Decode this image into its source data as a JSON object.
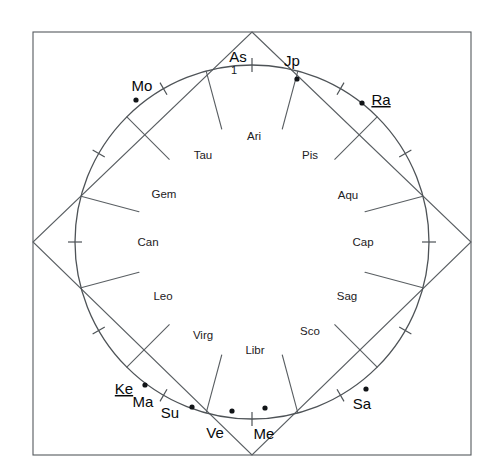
{
  "chart_data": {
    "type": "scatter",
    "title": "",
    "subtitle": "",
    "grid": false,
    "legend_position": "none",
    "xlabel": "",
    "ylabel": "",
    "coordinate_system": "polar-degrees-clockwise-from-top",
    "geometry": {
      "center_x": 252,
      "center_y": 242,
      "circle_radius": 177,
      "frame": {
        "x": 33,
        "y": 32,
        "width": 438,
        "height": 423
      },
      "diamond_vertices": [
        {
          "x": 252,
          "y": 32
        },
        {
          "x": 471,
          "y": 242
        },
        {
          "x": 252,
          "y": 455
        },
        {
          "x": 33,
          "y": 242
        }
      ]
    },
    "signs": [
      {
        "abbr": "Ari",
        "angle_deg": 0,
        "label_x": 254,
        "label_y": 137
      },
      {
        "abbr": "Tau",
        "angle_deg": 330,
        "label_x": 203,
        "label_y": 156
      },
      {
        "abbr": "Gem",
        "angle_deg": 300,
        "label_x": 164,
        "label_y": 195
      },
      {
        "abbr": "Can",
        "angle_deg": 270,
        "label_x": 148,
        "label_y": 243
      },
      {
        "abbr": "Leo",
        "angle_deg": 240,
        "label_x": 163,
        "label_y": 297
      },
      {
        "abbr": "Virg",
        "angle_deg": 210,
        "label_x": 203,
        "label_y": 336
      },
      {
        "abbr": "Libr",
        "angle_deg": 180,
        "label_x": 255,
        "label_y": 351
      },
      {
        "abbr": "Sco",
        "angle_deg": 150,
        "label_x": 310,
        "label_y": 332
      },
      {
        "abbr": "Sag",
        "angle_deg": 120,
        "label_x": 347,
        "label_y": 297
      },
      {
        "abbr": "Cap",
        "angle_deg": 90,
        "label_x": 363,
        "label_y": 243
      },
      {
        "abbr": "Aqu",
        "angle_deg": 60,
        "label_x": 348,
        "label_y": 196
      },
      {
        "abbr": "Pis",
        "angle_deg": 30,
        "label_x": 310,
        "label_y": 156
      }
    ],
    "planets": [
      {
        "abbr": "As",
        "name": "ascendant",
        "underlined": false,
        "label_x": 238,
        "label_y": 58,
        "dot_x": 222,
        "dot_y": 78,
        "show_dot": false
      },
      {
        "abbr": "Jp",
        "name": "jupiter",
        "underlined": false,
        "label_x": 292,
        "label_y": 62,
        "dot_x": 297,
        "dot_y": 79,
        "show_dot": true
      },
      {
        "abbr": "Ra",
        "name": "rahu",
        "underlined": true,
        "label_x": 381,
        "label_y": 101,
        "dot_x": 362,
        "dot_y": 103,
        "show_dot": true
      },
      {
        "abbr": "Mo",
        "name": "moon",
        "underlined": false,
        "label_x": 142,
        "label_y": 87,
        "dot_x": 136,
        "dot_y": 100,
        "show_dot": true
      },
      {
        "abbr": "Ke",
        "name": "ketu",
        "underlined": true,
        "label_x": 124,
        "label_y": 390,
        "dot_x": 145,
        "dot_y": 385,
        "show_dot": true
      },
      {
        "abbr": "Ma",
        "name": "mars",
        "underlined": false,
        "label_x": 143,
        "label_y": 403,
        "dot_x": 145,
        "dot_y": 385,
        "show_dot": false
      },
      {
        "abbr": "Su",
        "name": "sun",
        "underlined": false,
        "label_x": 170,
        "label_y": 414,
        "dot_x": 192,
        "dot_y": 407,
        "show_dot": true
      },
      {
        "abbr": "Ve",
        "name": "venus",
        "underlined": false,
        "label_x": 215,
        "label_y": 434,
        "dot_x": 232,
        "dot_y": 411,
        "show_dot": true
      },
      {
        "abbr": "Me",
        "name": "mercury",
        "underlined": false,
        "label_x": 264,
        "label_y": 435,
        "dot_x": 265,
        "dot_y": 408,
        "show_dot": true
      },
      {
        "abbr": "Sa",
        "name": "saturn",
        "underlined": false,
        "label_x": 362,
        "label_y": 405,
        "dot_x": 366,
        "dot_y": 389,
        "show_dot": true
      }
    ],
    "house_numbers": [
      {
        "number": "1",
        "x": 234,
        "y": 71
      }
    ],
    "tick_marks_deg": [
      0,
      30,
      60,
      90,
      120,
      150,
      180,
      210,
      240,
      270,
      300,
      330
    ],
    "cusp_lines_deg": [
      15,
      45,
      75,
      105,
      135,
      165,
      195,
      225,
      255,
      285,
      315,
      345
    ],
    "colors": {
      "stroke": "#5a5f63",
      "circle": "#4e5357",
      "text": "#1d2124",
      "planet_text": "#07090b",
      "dot": "#111417",
      "background": "#ffffff"
    }
  }
}
